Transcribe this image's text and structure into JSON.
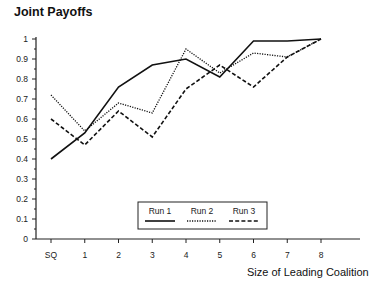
{
  "chart_data": {
    "type": "line",
    "title": "Joint Payoffs",
    "xlabel": "Size of Leading Coalition",
    "ylabel": "",
    "categories": [
      "SQ",
      "1",
      "2",
      "3",
      "4",
      "5",
      "6",
      "7",
      "8"
    ],
    "series": [
      {
        "name": "Run 1",
        "style": "solid",
        "values": [
          0.4,
          0.53,
          0.76,
          0.87,
          0.9,
          0.81,
          0.99,
          0.99,
          1.0
        ]
      },
      {
        "name": "Run 2",
        "style": "dotted",
        "values": [
          0.72,
          0.54,
          0.68,
          0.63,
          0.95,
          0.83,
          0.93,
          0.91,
          1.0
        ]
      },
      {
        "name": "Run 3",
        "style": "dashed",
        "values": [
          0.6,
          0.47,
          0.64,
          0.51,
          0.75,
          0.87,
          0.76,
          0.91,
          1.0
        ]
      }
    ],
    "yticks": [
      "0",
      "0.1",
      "0.2",
      "0.3",
      "0.4",
      "0.5",
      "0.6",
      "0.7",
      "0.8",
      "0.9",
      "1"
    ],
    "ylim": [
      0,
      1
    ],
    "grid": false,
    "legend_position": "inside-bottom-center"
  }
}
